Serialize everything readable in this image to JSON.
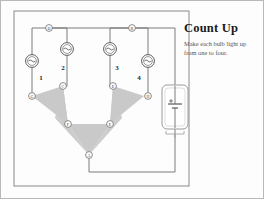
{
  "puzzle": {
    "title": "Count Up",
    "subtitle": "Make each bulb light up from one to four.",
    "bulb_labels": [
      "1",
      "2",
      "3",
      "4"
    ],
    "node_labels": [
      "A",
      "B",
      "C",
      "D",
      "E",
      "F",
      "G",
      "H"
    ],
    "components": {
      "lamp_icon": "lamp-icon",
      "battery_icon": "battery-icon",
      "wedge_icon": "wedge-shape"
    },
    "colors": {
      "wire": "#6e6e6e",
      "wedge_fill": "#c9c9c9",
      "frame": "#8a8a8a",
      "border": "#b9b9b9",
      "title_text": "#1a1a1a",
      "subtitle_text": "#555555"
    }
  }
}
